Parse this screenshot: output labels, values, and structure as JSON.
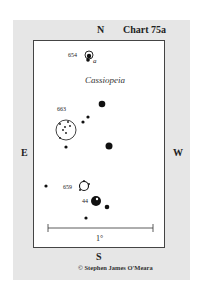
{
  "chart": {
    "title": "Chart 75a",
    "constellation": "Cassiopeia",
    "credit": "© Stephen James O'Meara",
    "scale_label": "1°",
    "directions": {
      "north": "N",
      "south": "S",
      "east": "E",
      "west": "W"
    }
  },
  "objects": [
    {
      "id": "654",
      "label": "654",
      "type": "nebula/cluster",
      "note": "a"
    },
    {
      "id": "663",
      "label": "663",
      "type": "open-cluster-circle"
    },
    {
      "id": "659",
      "label": "659",
      "type": "open-cluster"
    },
    {
      "id": "44",
      "label": "44",
      "type": "bright-star"
    }
  ],
  "colors": {
    "panel": "#e6e6e6",
    "frame_border": "#444444",
    "star": "#111111"
  }
}
